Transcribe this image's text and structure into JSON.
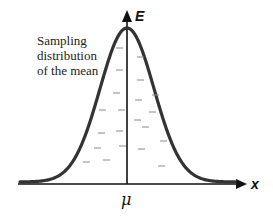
{
  "diagram": {
    "title": "Sampling distribution of the mean",
    "caption_lines": [
      "Sampling",
      "distribution",
      "of the mean"
    ],
    "y_axis_label": "E",
    "x_axis_label": "x",
    "center_label": "μ",
    "sample_mean_symbol": "x",
    "curve": "normal (bell-shaped) distribution centered at μ",
    "sample_means_count": 20,
    "colors": {
      "curve": "#333333",
      "axes": "#111111",
      "sample_means": "#8a8a8a"
    }
  }
}
